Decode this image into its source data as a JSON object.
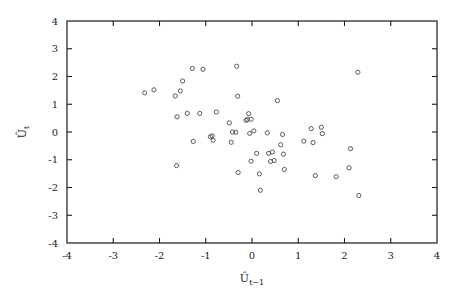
{
  "chart_data": {
    "type": "scatter",
    "title": "",
    "xlabel": "Û_{t−1}",
    "ylabel": "Û_t",
    "xlabel_base": "Û",
    "xlabel_sub": "t−1",
    "ylabel_base": "Û",
    "ylabel_sub": "t",
    "xlim": [
      -4,
      4
    ],
    "ylim": [
      -4,
      4
    ],
    "xticks": [
      -4,
      -3,
      -2,
      -1,
      0,
      1,
      2,
      3,
      4
    ],
    "yticks": [
      -4,
      -3,
      -2,
      -1,
      0,
      1,
      2,
      3,
      4
    ],
    "xtick_labels": [
      "-4",
      "-3",
      "-2",
      "-1",
      "0",
      "1",
      "2",
      "3",
      "4"
    ],
    "ytick_labels": [
      "-4",
      "-3",
      "-2",
      "-1",
      "0",
      "1",
      "2",
      "3",
      "4"
    ],
    "grid": false,
    "legend": "none",
    "marker": "open-circle",
    "marker_color": "#4a4a4a",
    "marker_size": 4.2,
    "n_points": 58,
    "points": [
      [
        -2.32,
        1.41
      ],
      [
        -2.12,
        1.52
      ],
      [
        -1.66,
        1.3
      ],
      [
        -1.62,
        0.55
      ],
      [
        -1.63,
        -1.21
      ],
      [
        -1.55,
        1.48
      ],
      [
        -1.5,
        1.84
      ],
      [
        -1.4,
        0.67
      ],
      [
        -1.29,
        2.29
      ],
      [
        -1.27,
        -0.34
      ],
      [
        -1.13,
        0.67
      ],
      [
        -1.06,
        2.26
      ],
      [
        -0.9,
        -0.17
      ],
      [
        -0.86,
        -0.14
      ],
      [
        -0.84,
        -0.3
      ],
      [
        -0.77,
        0.72
      ],
      [
        -0.49,
        0.33
      ],
      [
        -0.45,
        -0.37
      ],
      [
        -0.42,
        0.0
      ],
      [
        -0.35,
        -0.01
      ],
      [
        -0.33,
        2.37
      ],
      [
        -0.31,
        1.29
      ],
      [
        -0.3,
        -1.46
      ],
      [
        -0.13,
        0.42
      ],
      [
        -0.1,
        0.45
      ],
      [
        -0.07,
        0.66
      ],
      [
        -0.05,
        -0.05
      ],
      [
        -0.02,
        0.46
      ],
      [
        -0.02,
        -1.05
      ],
      [
        0.04,
        0.04
      ],
      [
        0.1,
        -0.77
      ],
      [
        0.16,
        -1.51
      ],
      [
        0.18,
        -2.1
      ],
      [
        0.33,
        -0.03
      ],
      [
        0.36,
        -0.77
      ],
      [
        0.4,
        -1.06
      ],
      [
        0.44,
        -0.72
      ],
      [
        0.48,
        -1.03
      ],
      [
        0.55,
        1.13
      ],
      [
        0.62,
        -0.46
      ],
      [
        0.66,
        -0.09
      ],
      [
        0.68,
        -0.8
      ],
      [
        0.7,
        -1.35
      ],
      [
        1.12,
        -0.33
      ],
      [
        1.28,
        0.12
      ],
      [
        1.32,
        -0.38
      ],
      [
        1.37,
        -1.57
      ],
      [
        1.5,
        0.17
      ],
      [
        1.52,
        -0.06
      ],
      [
        1.82,
        -1.61
      ],
      [
        2.1,
        -1.29
      ],
      [
        2.13,
        -0.6
      ],
      [
        2.29,
        2.15
      ],
      [
        2.31,
        -2.29
      ]
    ]
  },
  "figure": {
    "background_color": "#ffffff",
    "axis_color": "#1a1a1a"
  }
}
